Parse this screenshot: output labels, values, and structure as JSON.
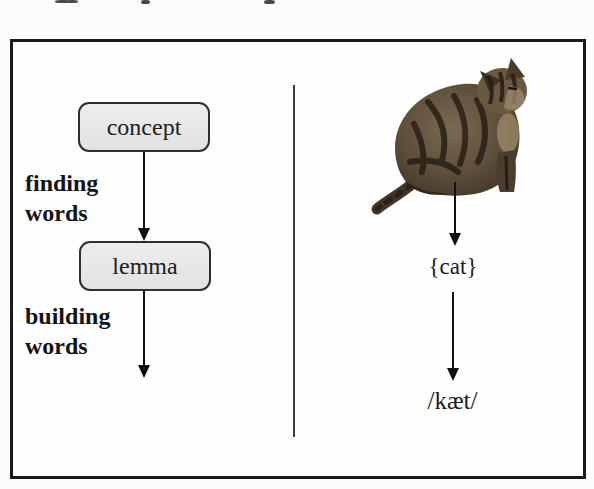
{
  "figure": {
    "panel_border_color": "#1a1a1a",
    "divider_color": "#3d3d3d"
  },
  "process": {
    "node_fill": "#e8e8e8",
    "node_border": "#2e2e2e",
    "nodes": [
      {
        "label": "concept"
      },
      {
        "label": "lemma"
      },
      {
        "label": "lexeme"
      }
    ],
    "stage_labels": [
      {
        "line1": "finding",
        "line2": "words"
      },
      {
        "line1": "building",
        "line2": "words"
      }
    ]
  },
  "example": {
    "image": "tabby-cat-photo",
    "lemma_form": "{cat}",
    "phonetic_form": "/kæt/"
  }
}
